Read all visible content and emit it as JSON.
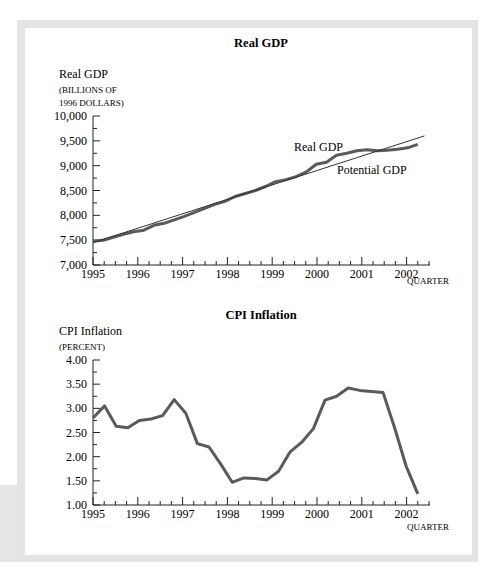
{
  "chart_data": [
    {
      "type": "line",
      "title": "Real GDP",
      "ylabel_lines": [
        "Real GDP",
        "(billions of",
        "1996 dollars)"
      ],
      "xlabel": "Quarter",
      "ylim": [
        7000,
        10000
      ],
      "yticks": [
        "7,000",
        "7,500",
        "8,000",
        "8,500",
        "9,000",
        "9,500",
        "10,000"
      ],
      "xticks": [
        "1995",
        "1996",
        "1997",
        "1998",
        "1999",
        "2000",
        "2001",
        "2002"
      ],
      "grid": false,
      "series": [
        {
          "name": "Real GDP",
          "x": [
            1995.0,
            1995.25,
            1995.5,
            1995.75,
            1996.0,
            1996.25,
            1996.5,
            1996.75,
            1997.0,
            1997.25,
            1997.5,
            1997.75,
            1998.0,
            1998.25,
            1998.5,
            1998.75,
            1999.0,
            1999.25,
            1999.5,
            1999.75,
            2000.0,
            2000.25,
            2000.5,
            2000.75,
            2001.0,
            2001.25,
            2001.5,
            2001.75,
            2002.0,
            2002.25
          ],
          "values": [
            7480,
            7500,
            7560,
            7620,
            7670,
            7700,
            7800,
            7840,
            7910,
            7980,
            8060,
            8140,
            8220,
            8280,
            8380,
            8440,
            8500,
            8580,
            8680,
            8720,
            8780,
            8870,
            9030,
            9070,
            9210,
            9250,
            9300,
            9320,
            9300,
            9310,
            9330,
            9360,
            9430
          ]
        },
        {
          "name": "Potential GDP",
          "x": [
            1995.0,
            2002.4
          ],
          "values": [
            7450,
            9600
          ]
        }
      ],
      "annotations": [
        "Real GDP",
        "Potential GDP"
      ]
    },
    {
      "type": "line",
      "title": "CPI Inflation",
      "ylabel_lines": [
        "CPI Inflation",
        "(percent)"
      ],
      "xlabel": "Quarter",
      "ylim": [
        1.0,
        4.0
      ],
      "yticks": [
        "1.00",
        "1.50",
        "2.00",
        "2.50",
        "3.00",
        "3.50",
        "4.00"
      ],
      "xticks": [
        "1995",
        "1996",
        "1997",
        "1998",
        "1999",
        "2000",
        "2001",
        "2002"
      ],
      "grid": false,
      "series": [
        {
          "name": "CPI Inflation",
          "x": [
            1995.0,
            1995.25,
            1995.5,
            1995.75,
            1996.0,
            1996.25,
            1996.5,
            1996.75,
            1997.0,
            1997.25,
            1997.5,
            1997.75,
            1998.0,
            1998.25,
            1998.5,
            1998.75,
            1999.0,
            1999.25,
            1999.5,
            1999.75,
            2000.0,
            2000.25,
            2000.5,
            2000.75,
            2001.0,
            2001.25,
            2001.5,
            2001.75,
            2002.0,
            2002.25
          ],
          "values": [
            2.8,
            3.05,
            2.63,
            2.6,
            2.75,
            2.78,
            2.85,
            3.18,
            2.9,
            2.27,
            2.2,
            1.85,
            1.47,
            1.56,
            1.55,
            1.52,
            1.7,
            2.1,
            2.3,
            2.58,
            3.17,
            3.25,
            3.42,
            3.37,
            3.35,
            3.33,
            2.6,
            1.8,
            1.23
          ]
        }
      ]
    }
  ],
  "gdp": {
    "title": "Real GDP",
    "ylabel1": "Real GDP",
    "ylabel2": "(billions of",
    "ylabel3": "1996 dollars)",
    "label_real": "Real GDP",
    "label_potential": "Potential GDP",
    "xlabel": "Quarter"
  },
  "cpi": {
    "title": "CPI Inflation",
    "ylabel1": "CPI Inflation",
    "ylabel2": "(percent)",
    "xlabel": "Quarter"
  },
  "colors": {
    "series": "#5a5a5a",
    "axis": "#222222",
    "potential": "#333333"
  }
}
